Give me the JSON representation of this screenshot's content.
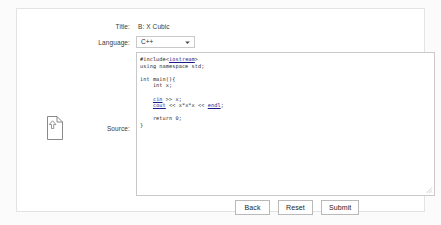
{
  "card": {
    "upload_icon": "document-upload-icon"
  },
  "form": {
    "title": {
      "label": "Title:",
      "value": "B: X Cubic"
    },
    "language": {
      "label": "Language:",
      "selected": "C++",
      "dropdown_icon": "chevron-down-icon"
    },
    "source": {
      "label": "Source:",
      "code_lines": [
        "#include<iostream>",
        "using namespace std;",
        "",
        "int main(){",
        "    int x;",
        "",
        "    cin >> x;",
        "    cout << x*x*x << endl;",
        "",
        "    return 0;",
        "}"
      ],
      "code_text": "#include<iostream>\nusing namespace std;\n\nint main(){\n    int x;\n\n    cin >> x;\n    cout << x*x*x << endl;\n\n    return 0;\n}",
      "resize_icon": "resize-grip-icon"
    }
  },
  "buttons": {
    "back": "Back",
    "reset": "Reset",
    "submit": "Submit"
  },
  "colors": {
    "page_background": "#fbfbfb",
    "card_background": "#ffffff",
    "card_border": "#e3e3e3",
    "control_border": "#c9c9c9",
    "button_border": "#b9b9b9",
    "text": "#3a3a3a",
    "code_text": "#1d1d1d",
    "code_keyword_link": "#1a1a8c"
  }
}
